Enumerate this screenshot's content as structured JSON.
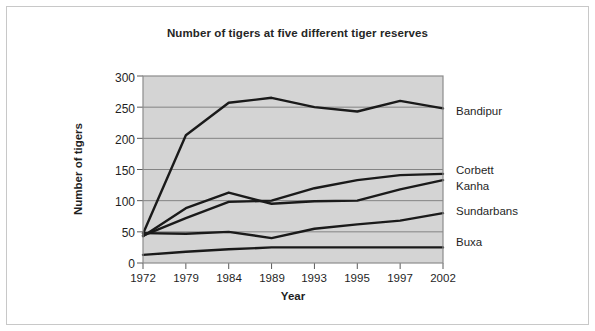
{
  "chart_data": {
    "type": "line",
    "title": "Number of tigers at five different tiger reserves",
    "xlabel": "Year",
    "ylabel": "Number of tigers",
    "categories": [
      "1972",
      "1979",
      "1984",
      "1989",
      "1993",
      "1995",
      "1997",
      "2002"
    ],
    "ylim": [
      0,
      300
    ],
    "yticks": [
      0,
      50,
      100,
      150,
      200,
      250,
      300
    ],
    "grid": true,
    "legend_position": "right-of-plot-at-line-end",
    "plot_background": "#d4d4d4",
    "line_color": "#1a1a1a",
    "series": [
      {
        "name": "Bandipur",
        "values": [
          47,
          205,
          257,
          265,
          250,
          243,
          260,
          248
        ]
      },
      {
        "name": "Corbett",
        "values": [
          44,
          72,
          98,
          100,
          120,
          133,
          141,
          143
        ]
      },
      {
        "name": "Kanha",
        "values": [
          43,
          88,
          113,
          95,
          99,
          100,
          118,
          133
        ]
      },
      {
        "name": "Sundarbans",
        "values": [
          48,
          47,
          50,
          40,
          55,
          62,
          68,
          80
        ]
      },
      {
        "name": "Buxa",
        "values": [
          13,
          18,
          22,
          25,
          25,
          25,
          25,
          25
        ]
      }
    ]
  },
  "axes": {
    "ytick_labels": [
      "300",
      "250",
      "200",
      "150",
      "100",
      "50",
      "0"
    ],
    "xtick_labels": [
      "1972",
      "1979",
      "1984",
      "1989",
      "1993",
      "1995",
      "1997",
      "2002"
    ]
  },
  "series_labels": [
    {
      "name": "Bandipur",
      "text": "Bandipur"
    },
    {
      "name": "Corbett",
      "text": "Corbett"
    },
    {
      "name": "Kanha",
      "text": "Kanha"
    },
    {
      "name": "Sundarbans",
      "text": "Sundarbans"
    },
    {
      "name": "Buxa",
      "text": "Buxa"
    }
  ]
}
